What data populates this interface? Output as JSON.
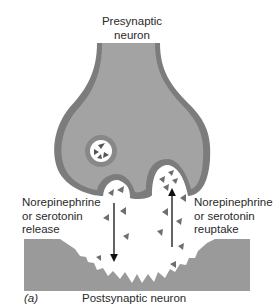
{
  "figure": {
    "panel_label": "(a)",
    "presynaptic_label": [
      "Presynaptic",
      "neuron"
    ],
    "postsynaptic_label": "Postsynaptic neuron",
    "release_label": [
      "Norepinephrine",
      "or serotonin",
      "release"
    ],
    "reuptake_label": [
      "Norepinephrine",
      "or serotonin",
      "reuptake"
    ]
  },
  "colors": {
    "neuron_fill": "#9e9e9e",
    "neuron_edge": "#7c7c7c",
    "postsynaptic_fill": "#9a9a9a",
    "molecule": "#6e6e6e",
    "arrow": "#111111",
    "background": "#ffffff"
  },
  "arrows": [
    {
      "name": "release",
      "direction": "down"
    },
    {
      "name": "reuptake",
      "direction": "up"
    }
  ]
}
